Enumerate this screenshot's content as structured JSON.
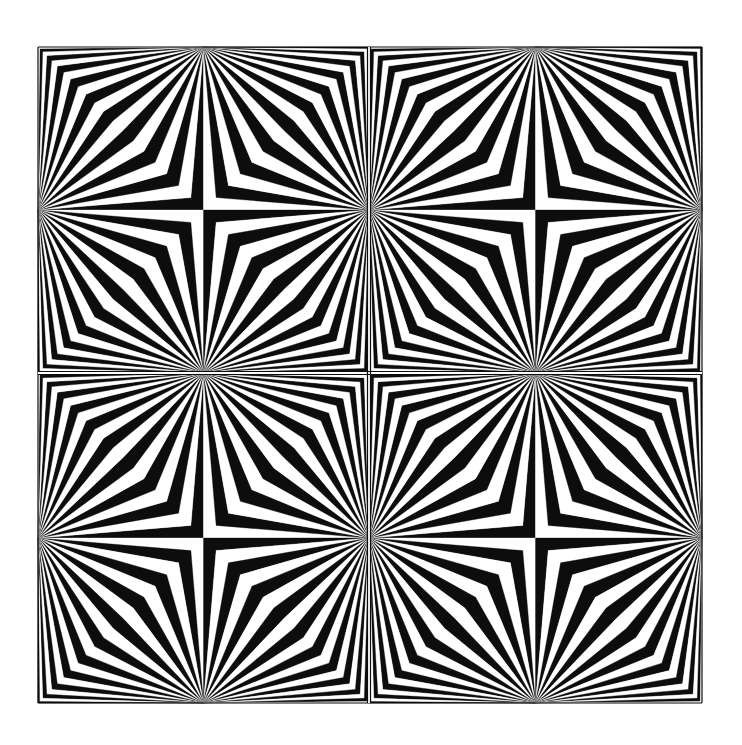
{
  "artwork": {
    "title": "",
    "style": "op-art radiating chevron pattern",
    "colors": {
      "background": "#ffffff",
      "ink": "#0d0d0d",
      "paper": "#ffffff"
    },
    "frame": {
      "x0": 38,
      "y0": 47,
      "x1": 702,
      "y1": 703,
      "divider_x": 369,
      "divider_y": 373,
      "outline_width": 1.2
    },
    "grid": {
      "rows": 2,
      "cols": 2
    },
    "bands_per_quadrant": 20,
    "band_spacing_exponent": 1.55,
    "innermost_band_color": "ink",
    "center_pinwheel": {
      "top_left": "ink",
      "top_right": "paper",
      "bottom_left": "paper",
      "bottom_right": "ink"
    }
  }
}
